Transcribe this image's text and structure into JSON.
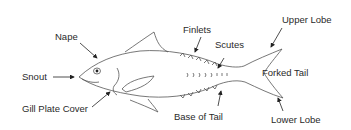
{
  "diagram": {
    "labels": {
      "nape": "Nape",
      "snout": "Snout",
      "gill_plate_cover": "Gill Plate Cover",
      "finlets": "Finlets",
      "scutes": "Scutes",
      "upper_lobe": "Upper Lobe",
      "forked_tail": "Forked Tail",
      "base_of_tail": "Base of Tail",
      "lower_lobe": "Lower Lobe"
    },
    "colors": {
      "outline": "#555555",
      "text": "#2a2a2a",
      "background": "#ffffff"
    }
  }
}
